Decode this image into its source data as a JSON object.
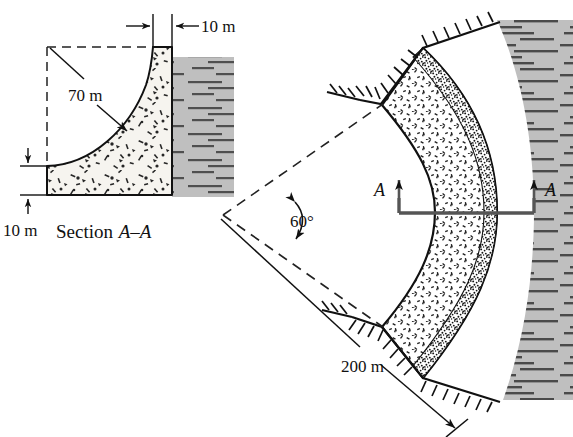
{
  "figure": {
    "background_color": "#ffffff",
    "line_color": "#111111",
    "water_fill": "#bfbfbf",
    "water_line_color": "#4a4a4a",
    "concrete_fill": "#f4f2ec",
    "stipple_color": "#2b2b2b"
  },
  "section_view": {
    "caption_prefix": "Section ",
    "caption_label": "A–A",
    "dimensions": {
      "crest_thickness": "10 m",
      "radius": "70 m",
      "base_thickness": "10 m"
    }
  },
  "plan_view": {
    "dimensions": {
      "included_angle": "60°",
      "radius": "200 m"
    },
    "section_marks": {
      "left_label": "A",
      "right_label": "A"
    }
  },
  "values": {
    "crest_thickness_m": 10,
    "base_thickness_m": 10,
    "section_radius_m": 70,
    "plan_radius_m": 200,
    "included_angle_deg": 60
  }
}
